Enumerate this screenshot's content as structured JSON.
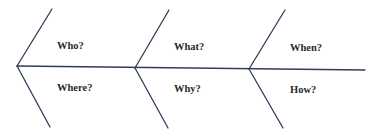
{
  "diagram": {
    "type": "fishbone",
    "line_color": "#2f3e5a",
    "labels": {
      "who": "Who?",
      "where": "Where?",
      "what": "What?",
      "why": "Why?",
      "when": "When?",
      "how": "How?"
    }
  }
}
